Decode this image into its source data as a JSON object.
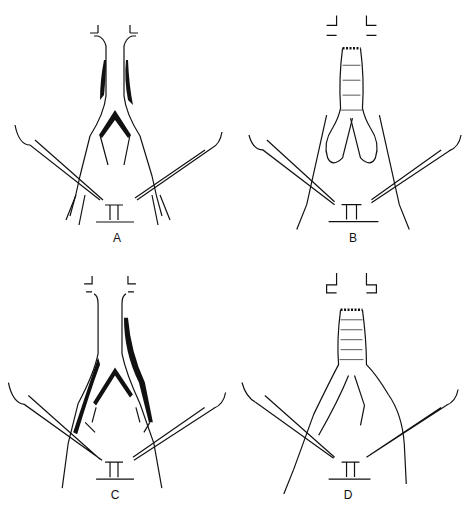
{
  "figure": {
    "panels": [
      {
        "id": "A",
        "label": "A",
        "description": "Native aortoiliac anatomy with occlusive disease in aorta and iliac arteries"
      },
      {
        "id": "B",
        "label": "B",
        "description": "Aortobifemoral bypass graft, end-to-end proximal anastomosis, distal anastomoses to iliacs"
      },
      {
        "id": "C",
        "label": "C",
        "description": "Native aortoiliac anatomy with occlusive disease extending into iliac branches"
      },
      {
        "id": "D",
        "label": "D",
        "description": "Bifurcated graft with limbs tunneled to femoral arteries under inguinal ligament"
      }
    ],
    "colors": {
      "ink": "#111111",
      "background": "#ffffff"
    }
  }
}
